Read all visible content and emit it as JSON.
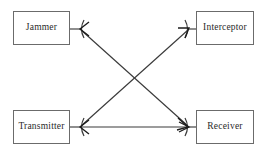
{
  "diagram": {
    "background_color": "#ffffff",
    "box_border_color": "#6b6b6b",
    "line_color": "#3a3a3a",
    "text_color": "#2a2a2a",
    "nodes": [
      {
        "id": "jammer",
        "label": "Jammer",
        "position": "top-left"
      },
      {
        "id": "interceptor",
        "label": "Interceptor",
        "position": "top-right"
      },
      {
        "id": "transmitter",
        "label": "Transmitter",
        "position": "bottom-left"
      },
      {
        "id": "receiver",
        "label": "Receiver",
        "position": "bottom-right"
      }
    ],
    "edges": [
      {
        "id": "transmitter-to-receiver",
        "from": "transmitter",
        "to": "receiver",
        "style": "horizontal",
        "arrow": "single"
      },
      {
        "id": "transmitter-to-interceptor",
        "from": "transmitter",
        "to": "interceptor",
        "style": "diagonal",
        "arrow": "single"
      },
      {
        "id": "jammer-to-receiver",
        "from": "jammer",
        "to": "receiver",
        "style": "diagonal",
        "arrow": "single"
      }
    ]
  }
}
